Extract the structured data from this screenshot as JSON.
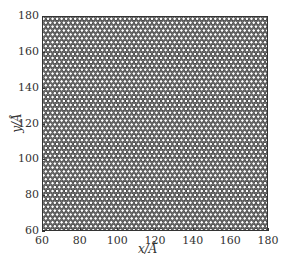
{
  "chart_data": {
    "type": "scatter",
    "title": "",
    "xlabel": "x/Å",
    "ylabel": "y/Å",
    "xlim": [
      60,
      180
    ],
    "ylim": [
      60,
      180
    ],
    "xticks": [
      "60",
      "80",
      "100",
      "120",
      "140",
      "160",
      "180"
    ],
    "yticks": [
      "60",
      "80",
      "100",
      "120",
      "140",
      "160",
      "180"
    ],
    "grid": false,
    "legend": null,
    "lattice": {
      "pattern": "hexagonal",
      "approx_spacing_angstrom": 2.4,
      "marker": "circle",
      "marker_fill": "#ffffff",
      "marker_edge": "#3a3a3a"
    }
  },
  "axes": {
    "x_label": "x/Å",
    "y_label": "y/Å"
  },
  "colors": {
    "frame": "#333333",
    "marker_edge": "#3a3a3a",
    "marker_fill": "#ffffff",
    "background": "#ffffff"
  }
}
